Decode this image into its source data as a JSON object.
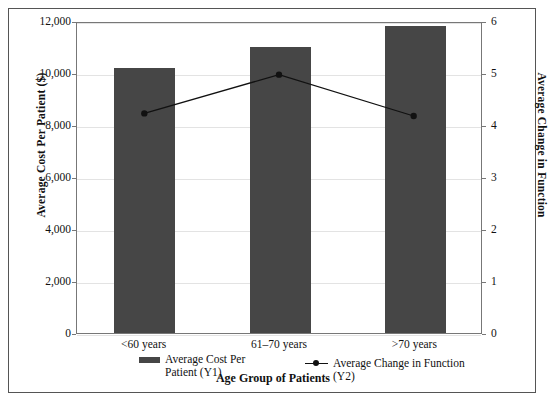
{
  "chart_data": {
    "type": "bar",
    "title": "",
    "categories": [
      "<60 years",
      "61–70 years",
      ">70 years"
    ],
    "series": [
      {
        "name": "Average Cost Per Patient (Y1)",
        "type": "bar",
        "axis": "y1",
        "values": [
          10200,
          11000,
          11800
        ],
        "color": "#464646"
      },
      {
        "name": "Average Change in Function (Y2)",
        "type": "line",
        "axis": "y2",
        "values": [
          4.25,
          5.0,
          4.2
        ],
        "color": "#111111"
      }
    ],
    "xlabel": "Age Group of Patients",
    "ylabel": "Average Cost Per Patient ($)",
    "y2label": "Average Change in Function",
    "ylim": [
      0,
      12000
    ],
    "y2lim": [
      0,
      6
    ],
    "yticks": [
      0,
      2000,
      4000,
      6000,
      8000,
      10000,
      12000
    ],
    "ytick_labels": [
      "0",
      "2,000",
      "4,000",
      "6,000",
      "8,000",
      "10,000",
      "12,000"
    ],
    "y2ticks": [
      0,
      1,
      2,
      3,
      4,
      5,
      6
    ],
    "y2tick_labels": [
      "0",
      "1",
      "2",
      "3",
      "4",
      "5",
      "6"
    ],
    "grid": true,
    "legend_position": "bottom"
  },
  "axes": {
    "left_title": "Average Cost Per Patient ($)",
    "right_title": "Average Change in Function",
    "x_title": "Age Group of Patients"
  },
  "legend": {
    "bar_label": "Average Cost Per\nPatient (Y1)",
    "line_label": "Average Change in Function (Y2)"
  }
}
